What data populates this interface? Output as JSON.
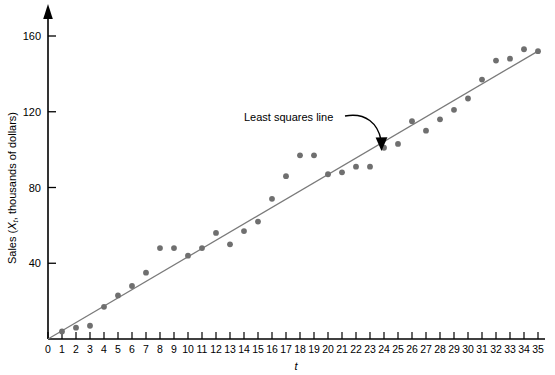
{
  "chart_data": {
    "type": "scatter",
    "title": "",
    "xlabel": "t",
    "ylabel": "Sales (X, thousands of dollars)",
    "ylabel_prefix": "Sales (",
    "ylabel_var": "X",
    "ylabel_sub": "t",
    "ylabel_suffix": ", thousands of dollars)",
    "xlim": [
      0,
      35
    ],
    "ylim": [
      0,
      170
    ],
    "grid": false,
    "legend": "none",
    "y_ticks": [
      40,
      80,
      120,
      160
    ],
    "y_tick_labels": [
      "40",
      "80",
      "120",
      "160"
    ],
    "x_ticks": [
      0,
      1,
      2,
      3,
      4,
      5,
      6,
      7,
      8,
      9,
      10,
      11,
      12,
      13,
      14,
      15,
      16,
      17,
      18,
      19,
      20,
      21,
      22,
      23,
      24,
      25,
      26,
      27,
      28,
      29,
      30,
      31,
      32,
      33,
      34,
      35
    ],
    "x_tick_labels": [
      "0",
      "1",
      "2",
      "3",
      "4",
      "5",
      "6",
      "7",
      "8",
      "9",
      "10",
      "11",
      "12",
      "13",
      "14",
      "15",
      "16",
      "17",
      "18",
      "19",
      "20",
      "21",
      "22",
      "23",
      "24",
      "25",
      "26",
      "27",
      "28",
      "29",
      "30",
      "31",
      "32",
      "33",
      "34",
      "35"
    ],
    "x": [
      1,
      2,
      3,
      4,
      5,
      6,
      7,
      8,
      9,
      10,
      11,
      12,
      13,
      14,
      15,
      16,
      17,
      18,
      19,
      20,
      21,
      22,
      23,
      24,
      25,
      26,
      27,
      28,
      29,
      30,
      31,
      32,
      33,
      34,
      35
    ],
    "y": [
      4,
      6,
      7,
      17,
      23,
      28,
      35,
      48,
      48,
      44,
      48,
      56,
      50,
      57,
      62,
      74,
      86,
      97,
      97,
      87,
      88,
      91,
      91,
      101,
      103,
      115,
      110,
      116,
      121,
      127,
      137,
      147,
      148,
      153,
      152
    ],
    "series": [
      {
        "name": "Sales observations",
        "marker": "circle",
        "color": "#6f6f6f",
        "values": [
          4,
          6,
          7,
          17,
          23,
          28,
          35,
          48,
          48,
          44,
          48,
          56,
          50,
          57,
          62,
          74,
          86,
          97,
          97,
          87,
          88,
          91,
          91,
          101,
          103,
          115,
          110,
          116,
          121,
          127,
          137,
          147,
          148,
          153,
          152
        ]
      }
    ],
    "fit_line": {
      "label": "Least squares line",
      "color": "#7a7a7a",
      "x_start": 0,
      "y_start": 0,
      "x_end": 35,
      "y_end": 152
    },
    "annotations": [
      {
        "text": "Least squares line",
        "target_x": 23,
        "target_y": 100
      }
    ]
  },
  "axis": {
    "y_arrow": "up-arrow-icon",
    "y_tick_0": "40",
    "y_tick_1": "80",
    "y_tick_2": "120",
    "y_tick_3": "160"
  }
}
